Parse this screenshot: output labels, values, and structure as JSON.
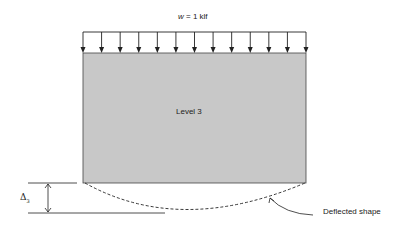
{
  "diagram": {
    "load_label": {
      "symbol": "w",
      "rest": " = 1 klf"
    },
    "floor_label": "Level 3",
    "deflection_symbol": "Δ",
    "deflection_subscript": "3",
    "deflected_shape_label": "Deflected shape",
    "colors": {
      "floor_fill": "#c8c8c8",
      "line": "#222222"
    },
    "load_arrow_count": 13
  }
}
